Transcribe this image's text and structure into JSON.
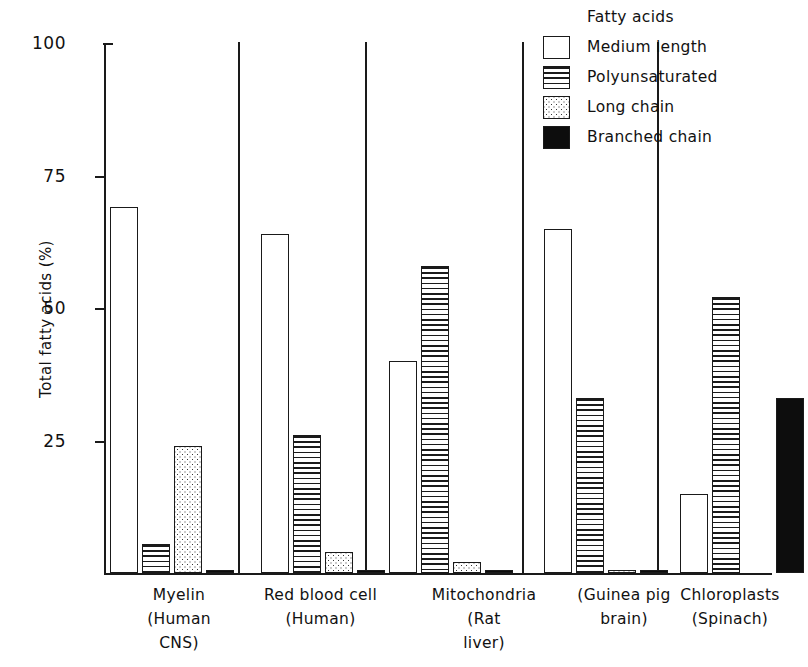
{
  "chart_data": {
    "type": "bar",
    "title": "",
    "xlabel": "",
    "ylabel": "Total fatty acids (%)",
    "ylim": [
      0,
      100
    ],
    "yticks": [
      0,
      25,
      50,
      75,
      100
    ],
    "ytick_labels": [
      "",
      "25",
      "50",
      "75",
      "100"
    ],
    "grid": false,
    "legend_position": "top-right",
    "legend_title": "Fatty acids",
    "categories": [
      "Myelin\n(Human\nCNS)",
      "Red blood cell\n(Human)",
      "Mitochondria\n(Rat\nliver)",
      "(Guinea pig\nbrain)",
      "Chloroplasts\n(Spinach)"
    ],
    "series": [
      {
        "name": "Medium length",
        "pattern": "open",
        "values": [
          69,
          64,
          40,
          65,
          15
        ]
      },
      {
        "name": "Polyunsaturated",
        "pattern": "horiz-lines",
        "values": [
          5.5,
          26,
          58,
          33,
          52
        ]
      },
      {
        "name": "Long chain",
        "pattern": "stipple",
        "values": [
          24,
          4,
          2,
          0.6,
          0
        ]
      },
      {
        "name": "Branched chain",
        "pattern": "solid-black",
        "values": [
          0.6,
          0.5,
          0.6,
          0.6,
          33
        ]
      }
    ]
  },
  "axis": {
    "y_label": "Total fatty acids (%)",
    "tick_100": "100",
    "tick_75": "75",
    "tick_50": "50",
    "tick_25": "25"
  },
  "legend": {
    "title": "Fatty acids",
    "items": [
      {
        "label": "Medium length"
      },
      {
        "label": "Polyunsaturated"
      },
      {
        "label": "Long chain"
      },
      {
        "label": "Branched chain"
      }
    ]
  },
  "groups": [
    {
      "label": "Myelin\n(Human\nCNS)"
    },
    {
      "label": "Red blood cell\n(Human)"
    },
    {
      "label": "Mitochondria\n(Rat\nliver)"
    },
    {
      "label": "(Guinea pig\nbrain)"
    },
    {
      "label": "Chloroplasts\n(Spinach)"
    }
  ]
}
